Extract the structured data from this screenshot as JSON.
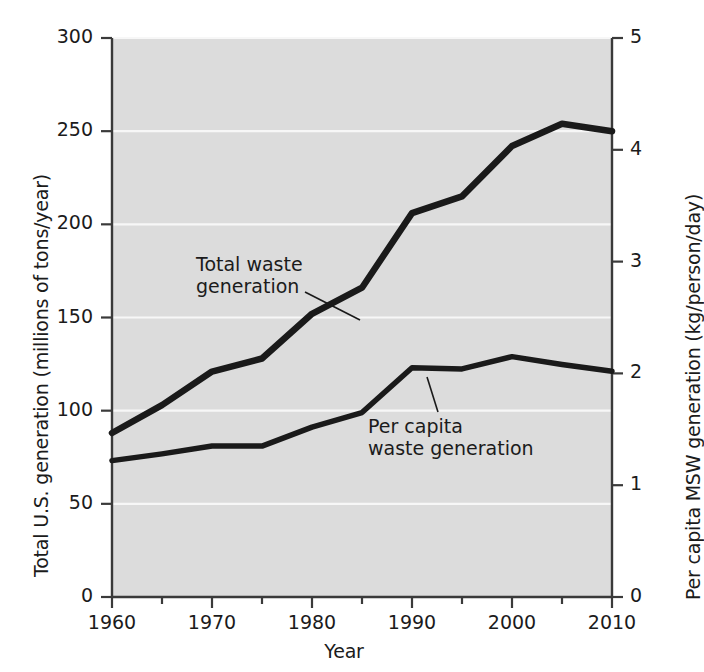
{
  "chart_data": {
    "type": "line",
    "title": "",
    "xlabel": "Year",
    "ylabel": "Total U.S. generation (millions of tons/year)",
    "y2label": "Per capita MSW generation (kg/person/day)",
    "x": [
      1960,
      1965,
      1970,
      1975,
      1980,
      1985,
      1990,
      1995,
      2000,
      2005,
      2010
    ],
    "xlim": [
      1960,
      2010
    ],
    "ylim": [
      0,
      300
    ],
    "y2lim": [
      0,
      5
    ],
    "xticks": [
      "1960",
      "1970",
      "1980",
      "1990",
      "2000",
      "2010"
    ],
    "xtick_values": [
      1960,
      1970,
      1980,
      1990,
      2000,
      2010
    ],
    "xminor_values": [
      1965,
      1975,
      1985,
      1995,
      2005
    ],
    "yticks": [
      "0",
      "50",
      "100",
      "150",
      "200",
      "250",
      "300"
    ],
    "ytick_values": [
      0,
      50,
      100,
      150,
      200,
      250,
      300
    ],
    "y2ticks": [
      "0",
      "1",
      "2",
      "3",
      "4",
      "5"
    ],
    "y2tick_values": [
      0,
      1,
      2,
      3,
      4,
      5
    ],
    "grid": "horizontal-white",
    "legend": "annotations",
    "plot_bg": "#dcdcdc",
    "line_color": "#1a1a1a",
    "grid_color": "#f7f7f7",
    "series": [
      {
        "name": "Total waste generation",
        "axis": "left",
        "values": [
          88,
          103,
          121,
          128,
          152,
          166,
          206,
          215,
          242,
          254,
          250
        ]
      },
      {
        "name": "Per capita waste generation",
        "axis": "right",
        "values": [
          1.22,
          1.28,
          1.35,
          1.35,
          1.52,
          1.65,
          2.05,
          2.04,
          2.15,
          2.08,
          2.02
        ]
      }
    ],
    "annotations": [
      {
        "text_line1": "Total waste",
        "text_line2": "generation",
        "target_series": "Total waste generation"
      },
      {
        "text_line1": "Per capita",
        "text_line2": "waste generation",
        "target_series": "Per capita waste generation"
      }
    ]
  }
}
